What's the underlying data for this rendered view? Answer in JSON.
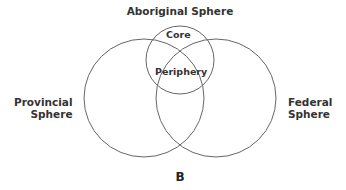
{
  "diagram": {
    "type": "venn",
    "title": "Aboriginal Sphere",
    "panel_label": "B",
    "spheres": [
      {
        "name": "Aboriginal Sphere",
        "sub_regions": [
          "Core",
          "Periphery"
        ]
      },
      {
        "name": "Provincial Sphere",
        "label_lines": [
          "Provincial",
          "Sphere"
        ]
      },
      {
        "name": "Federal Sphere",
        "label_lines": [
          "Federal",
          "Sphere"
        ]
      }
    ],
    "labels": {
      "top": "Aboriginal Sphere",
      "core": "Core",
      "periphery": "Periphery",
      "provincial_line1": "Provincial",
      "provincial_line2": "Sphere",
      "federal_line1": "Federal",
      "federal_line2": "Sphere"
    },
    "stroke_color": "#666666"
  }
}
